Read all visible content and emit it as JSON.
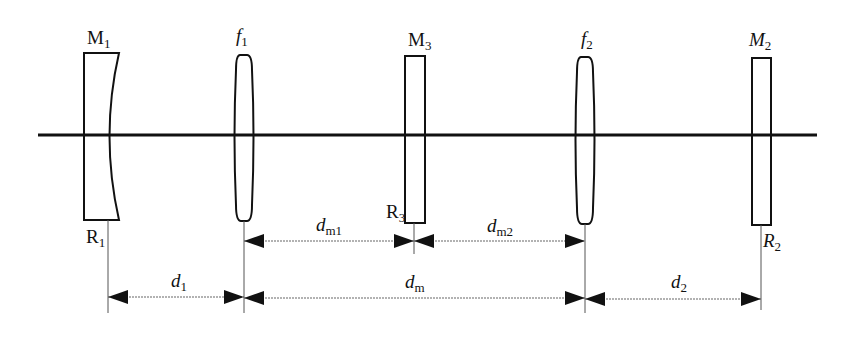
{
  "diagram": {
    "type": "optical-cavity-layout",
    "colors": {
      "stroke": "#111111",
      "background": "#ffffff",
      "guide": "#555555"
    },
    "optical_axis": {
      "y": 135,
      "x_start": 38,
      "x_end": 817
    },
    "components": [
      {
        "id": "M1",
        "kind": "concave-mirror",
        "label": "M",
        "label_sub": "1",
        "italic": false,
        "ref_label": "R",
        "ref_sub": "1",
        "x": 108
      },
      {
        "id": "f1",
        "kind": "lens",
        "label": "f",
        "label_sub": "1",
        "italic": true,
        "x": 244
      },
      {
        "id": "M3",
        "kind": "flat-mirror",
        "label": "M",
        "label_sub": "3",
        "italic": false,
        "ref_label": "R",
        "ref_sub": "3",
        "x": 414
      },
      {
        "id": "f2",
        "kind": "lens",
        "label": "f",
        "label_sub": "2",
        "italic": true,
        "x": 585
      },
      {
        "id": "M2",
        "kind": "flat-mirror",
        "label": "M",
        "label_sub": "2",
        "italic": true,
        "ref_label": "R",
        "ref_sub": "2",
        "x": 761
      }
    ],
    "dimensions": [
      {
        "id": "dm1",
        "label": "d",
        "label_sub": "m1",
        "from": "f1",
        "to": "M3",
        "row": 1
      },
      {
        "id": "dm2",
        "label": "d",
        "label_sub": "m2",
        "from": "M3",
        "to": "f2",
        "row": 1
      },
      {
        "id": "d1",
        "label": "d",
        "label_sub": "1",
        "from": "M1",
        "to": "f1",
        "row": 2
      },
      {
        "id": "dm",
        "label": "d",
        "label_sub": "m",
        "from": "f1",
        "to": "f2",
        "row": 2
      },
      {
        "id": "d2",
        "label": "d",
        "label_sub": "2",
        "from": "f2",
        "to": "M2",
        "row": 2
      }
    ]
  },
  "labels": {
    "M1": {
      "main": "M",
      "sub": "1"
    },
    "f1": {
      "main": "f",
      "sub": "1"
    },
    "M3": {
      "main": "M",
      "sub": "3"
    },
    "f2": {
      "main": "f",
      "sub": "2"
    },
    "M2": {
      "main": "M",
      "sub": "2"
    },
    "R1": {
      "main": "R",
      "sub": "1"
    },
    "R3": {
      "main": "R",
      "sub": "3"
    },
    "R2": {
      "main": "R",
      "sub": "2"
    },
    "dm1": {
      "main": "d",
      "sub": "m1"
    },
    "dm2": {
      "main": "d",
      "sub": "m2"
    },
    "d1": {
      "main": "d",
      "sub": "1"
    },
    "dm": {
      "main": "d",
      "sub": "m"
    },
    "d2": {
      "main": "d",
      "sub": "2"
    }
  }
}
